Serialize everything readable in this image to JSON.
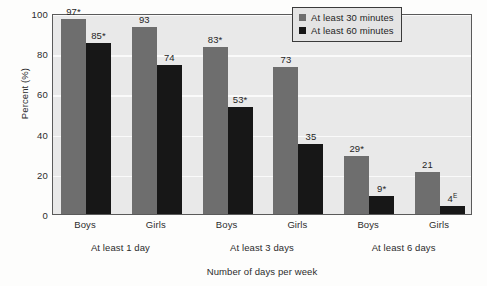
{
  "chart_data": {
    "type": "bar",
    "title": "",
    "xlabel": "Number of days per week",
    "ylabel": "Percent (%)",
    "ylim": [
      0,
      100
    ],
    "yticks": [
      0,
      20,
      40,
      60,
      80,
      100
    ],
    "grid": true,
    "legend_position": "top-right",
    "categories": [
      "Boys",
      "Girls",
      "Boys",
      "Girls",
      "Boys",
      "Girls"
    ],
    "group_labels": [
      "At least 1 day",
      "At least 3 days",
      "At least 6 days"
    ],
    "series": [
      {
        "name": "At least 30 minutes",
        "color": "#6e6e6e",
        "values": [
          97,
          93,
          83,
          73,
          29,
          21
        ],
        "labels": [
          "97*",
          "93",
          "83*",
          "73",
          "29*",
          "21"
        ]
      },
      {
        "name": "At least 60 minutes",
        "color": "#171717",
        "values": [
          85,
          74,
          53,
          35,
          9,
          4
        ],
        "labels": [
          "85*",
          "74",
          "53*",
          "35",
          "9*",
          "4E"
        ]
      }
    ],
    "annotations": {
      "asterisk_marked": [
        "97*",
        "85*",
        "83*",
        "53*",
        "29*",
        "9*"
      ],
      "superscript_E_marked": [
        "4E"
      ]
    }
  },
  "axis": {
    "y_title": "Percent (%)",
    "x_title": "Number of days per week",
    "y_ticks": [
      "100",
      "80",
      "60",
      "40",
      "20",
      "0"
    ]
  },
  "legend": {
    "items": [
      {
        "label": "At least 30 minutes",
        "swatch": "gray"
      },
      {
        "label": "At least 60 minutes",
        "swatch": "black"
      }
    ]
  },
  "bars": [
    {
      "value_text": "97",
      "suffix": "*",
      "sup": "",
      "height": 97,
      "series": "gray"
    },
    {
      "value_text": "85",
      "suffix": "*",
      "sup": "",
      "height": 85,
      "series": "black"
    },
    {
      "value_text": "93",
      "suffix": "",
      "sup": "",
      "height": 93,
      "series": "gray"
    },
    {
      "value_text": "74",
      "suffix": "",
      "sup": "",
      "height": 74,
      "series": "black"
    },
    {
      "value_text": "83",
      "suffix": "*",
      "sup": "",
      "height": 83,
      "series": "gray"
    },
    {
      "value_text": "53",
      "suffix": "*",
      "sup": "",
      "height": 53,
      "series": "black"
    },
    {
      "value_text": "73",
      "suffix": "",
      "sup": "",
      "height": 73,
      "series": "gray"
    },
    {
      "value_text": "35",
      "suffix": "",
      "sup": "",
      "height": 35,
      "series": "black"
    },
    {
      "value_text": "29",
      "suffix": "*",
      "sup": "",
      "height": 29,
      "series": "gray"
    },
    {
      "value_text": "9",
      "suffix": "*",
      "sup": "",
      "height": 9,
      "series": "black"
    },
    {
      "value_text": "21",
      "suffix": "",
      "sup": "",
      "height": 21,
      "series": "gray"
    },
    {
      "value_text": "4",
      "suffix": "",
      "sup": "E",
      "height": 4,
      "series": "black"
    }
  ],
  "x_categories": [
    {
      "label": "Boys"
    },
    {
      "label": "Girls"
    },
    {
      "label": "Boys"
    },
    {
      "label": "Girls"
    },
    {
      "label": "Boys"
    },
    {
      "label": "Girls"
    }
  ],
  "x_groups": [
    {
      "label": "At least 1 day"
    },
    {
      "label": "At least 3 days"
    },
    {
      "label": "At least 6 days"
    }
  ]
}
